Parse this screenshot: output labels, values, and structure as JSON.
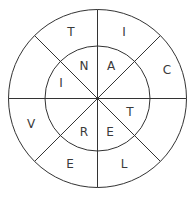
{
  "puzzle": {
    "type": "word-wheel",
    "outer_ring": [
      {
        "letter": "T",
        "x": 71,
        "y": 32
      },
      {
        "letter": "I",
        "x": 124,
        "y": 32
      },
      {
        "letter": "C",
        "x": 167,
        "y": 70
      },
      {
        "letter": "V",
        "x": 31,
        "y": 124
      },
      {
        "letter": "E",
        "x": 70,
        "y": 164
      },
      {
        "letter": "L",
        "x": 124,
        "y": 164
      }
    ],
    "inner_ring": [
      {
        "letter": "N",
        "x": 84,
        "y": 66
      },
      {
        "letter": "A",
        "x": 111,
        "y": 66
      },
      {
        "letter": "I",
        "x": 61,
        "y": 83
      },
      {
        "letter": "T",
        "x": 130,
        "y": 112
      },
      {
        "letter": "R",
        "x": 84,
        "y": 132
      },
      {
        "letter": "E",
        "x": 110,
        "y": 132
      }
    ]
  }
}
